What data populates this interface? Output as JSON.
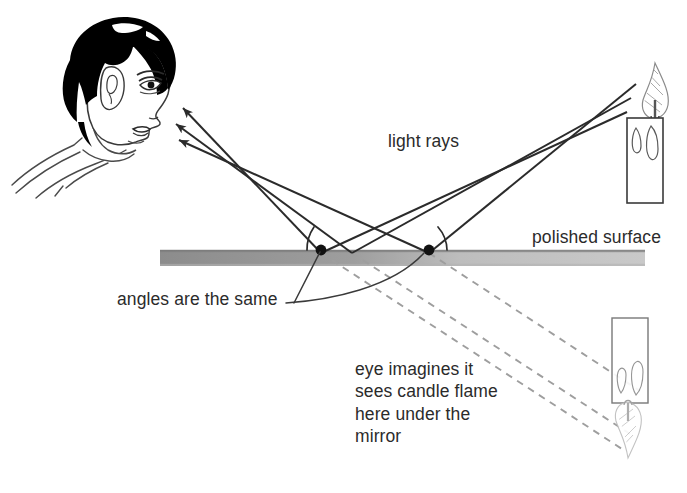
{
  "diagram": {
    "background_color": "#ffffff",
    "ink_color": "#2b2b2b",
    "mirror_color_left": "#8f8f8f",
    "mirror_color_right": "#c9c9c9",
    "virtual_ray_color": "#9a9a9a"
  },
  "labels": {
    "light_rays": "light rays",
    "polished_surface": "polished surface",
    "angles_are_the_same": "angles are the same",
    "eye_imagines": "eye imagines it\nsees candle flame\nhere under the\nmirror"
  },
  "elements": {
    "observer": "boy-head-profile-facing-right",
    "eye": "eye",
    "real_candle": "lit-candle-upright",
    "virtual_candle": "candle-image-inverted-below-mirror",
    "mirror": "polished-surface-bar",
    "incident_rays_count": 3,
    "reflected_rays_count": 3,
    "virtual_rays_count": 3,
    "reflection_points": 2,
    "angle_arcs": 2
  },
  "colors": {
    "solid_ray": "#2b2b2b",
    "dashed_ray": "#9e9e9e",
    "hair": "#000000",
    "outline": "#3a3a3a"
  }
}
